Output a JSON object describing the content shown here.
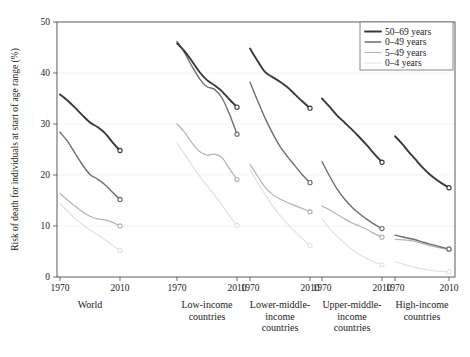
{
  "chart_data": {
    "type": "line",
    "title": "",
    "xlabel": "",
    "ylabel": "Risk of death for individuals at start of age range (%)",
    "ylim": [
      0,
      50
    ],
    "xlim": [
      1970,
      2010
    ],
    "yticks": [
      "0",
      "10",
      "20",
      "30",
      "40",
      "50"
    ],
    "ytick_values": [
      0,
      10,
      20,
      30,
      40,
      50
    ],
    "grid": "horizontal-faint",
    "legend_position": "top-right",
    "legend": [
      {
        "name": "50–69 years",
        "color": "#3a3a3a",
        "width": 1.9
      },
      {
        "name": "0–49 years",
        "color": "#6e6e6e",
        "width": 1.4
      },
      {
        "name": "5–49 years",
        "color": "#b4b4b4",
        "width": 1.2
      },
      {
        "name": "0–4 years",
        "color": "#e2e2e2",
        "width": 1.2
      }
    ],
    "panels": [
      {
        "label": "World",
        "label_lines": [
          "World"
        ],
        "xticks": [
          "1970",
          "2010"
        ],
        "series": [
          {
            "name": "50–69 years",
            "x": [
              1970,
              1975,
              1980,
              1985,
              1990,
              1995,
              2000,
              2005,
              2010
            ],
            "values": [
              35.8,
              34.6,
              33.2,
              31.7,
              30.3,
              29.4,
              28.2,
              26.4,
              24.8
            ],
            "endpoint_value": 24.8
          },
          {
            "name": "0–49 years",
            "x": [
              1970,
              1975,
              1980,
              1985,
              1990,
              1995,
              2000,
              2005,
              2010
            ],
            "values": [
              28.4,
              26.6,
              24.3,
              22.0,
              20.1,
              19.2,
              18.1,
              16.6,
              15.2
            ],
            "endpoint_value": 15.2
          },
          {
            "name": "5–49 years",
            "x": [
              1970,
              1975,
              1980,
              1985,
              1990,
              1995,
              2000,
              2005,
              2010
            ],
            "values": [
              16.4,
              15.1,
              13.9,
              12.8,
              11.9,
              11.4,
              11.2,
              10.7,
              10.0
            ],
            "endpoint_value": 10.0
          },
          {
            "name": "0–4 years",
            "x": [
              1970,
              1975,
              1980,
              1985,
              1990,
              1995,
              2000,
              2005,
              2010
            ],
            "values": [
              14.4,
              12.9,
              11.5,
              10.3,
              9.2,
              8.3,
              7.3,
              6.2,
              5.2
            ],
            "endpoint_value": 5.2
          }
        ]
      },
      {
        "label": "Low-income countries",
        "label_lines": [
          "Low-income",
          "countries"
        ],
        "xticks": [
          "1970",
          "2010"
        ],
        "series": [
          {
            "name": "50–69 years",
            "x": [
              1970,
              1975,
              1980,
              1985,
              1990,
              1995,
              2000,
              2005,
              2010
            ],
            "values": [
              45.8,
              44.3,
              42.3,
              40.2,
              38.6,
              37.6,
              36.4,
              34.8,
              33.3
            ],
            "endpoint_value": 33.3
          },
          {
            "name": "0–49 years",
            "x": [
              1970,
              1975,
              1980,
              1985,
              1990,
              1995,
              2000,
              2005,
              2010
            ],
            "values": [
              46.2,
              44.0,
              41.3,
              38.9,
              37.3,
              36.8,
              35.1,
              31.9,
              28.0
            ],
            "endpoint_value": 28.0
          },
          {
            "name": "5–49 years",
            "x": [
              1970,
              1975,
              1980,
              1985,
              1990,
              1995,
              2000,
              2005,
              2010
            ],
            "values": [
              30.0,
              28.4,
              26.3,
              24.6,
              23.9,
              24.1,
              23.4,
              21.2,
              19.1
            ],
            "endpoint_value": 19.1
          },
          {
            "name": "0–4 years",
            "x": [
              1970,
              1975,
              1980,
              1985,
              1990,
              1995,
              2000,
              2005,
              2010
            ],
            "values": [
              26.2,
              24.1,
              21.9,
              19.8,
              17.9,
              16.1,
              14.1,
              12.0,
              10.1
            ],
            "endpoint_value": 10.1
          }
        ]
      },
      {
        "label": "Lower-middle-income countries",
        "label_lines": [
          "Lower-middle-",
          "income",
          "countries"
        ],
        "xticks": [
          "1970",
          "2010"
        ],
        "series": [
          {
            "name": "50–69 years",
            "x": [
              1970,
              1975,
              1980,
              1985,
              1990,
              1995,
              2000,
              2005,
              2010
            ],
            "values": [
              44.8,
              42.4,
              40.2,
              39.2,
              38.3,
              37.2,
              35.8,
              34.4,
              33.1
            ],
            "endpoint_value": 33.1
          },
          {
            "name": "0–49 years",
            "x": [
              1970,
              1975,
              1980,
              1985,
              1990,
              1995,
              2000,
              2005,
              2010
            ],
            "values": [
              38.2,
              34.6,
              31.2,
              28.2,
              25.6,
              23.6,
              21.8,
              20.0,
              18.5
            ],
            "endpoint_value": 18.5
          },
          {
            "name": "5–49 years",
            "x": [
              1970,
              1975,
              1980,
              1985,
              1990,
              1995,
              2000,
              2005,
              2010
            ],
            "values": [
              22.1,
              19.8,
              17.6,
              16.2,
              15.3,
              14.6,
              14.0,
              13.4,
              12.8
            ],
            "endpoint_value": 12.8
          },
          {
            "name": "0–4 years",
            "x": [
              1970,
              1975,
              1980,
              1985,
              1990,
              1995,
              2000,
              2005,
              2010
            ],
            "values": [
              21.0,
              18.6,
              16.2,
              14.0,
              12.1,
              10.4,
              8.9,
              7.5,
              6.2
            ],
            "endpoint_value": 6.2
          }
        ]
      },
      {
        "label": "Upper-middle-income countries",
        "label_lines": [
          "Upper-middle-",
          "income",
          "countries"
        ],
        "xticks": [
          "1970",
          "2010"
        ],
        "series": [
          {
            "name": "50–69 years",
            "x": [
              1970,
              1975,
              1980,
              1985,
              1990,
              1995,
              2000,
              2005,
              2010
            ],
            "values": [
              35.0,
              33.4,
              31.7,
              30.3,
              28.9,
              27.4,
              25.8,
              24.1,
              22.5
            ],
            "endpoint_value": 22.5
          },
          {
            "name": "0–49 years",
            "x": [
              1970,
              1975,
              1980,
              1985,
              1990,
              1995,
              2000,
              2005,
              2010
            ],
            "values": [
              22.6,
              19.8,
              17.3,
              15.3,
              13.7,
              12.4,
              11.3,
              10.3,
              9.5
            ],
            "endpoint_value": 9.5
          },
          {
            "name": "5–49 years",
            "x": [
              1970,
              1975,
              1980,
              1985,
              1990,
              1995,
              2000,
              2005,
              2010
            ],
            "values": [
              13.9,
              13.2,
              12.3,
              11.4,
              10.6,
              10.0,
              9.3,
              8.5,
              7.8
            ],
            "endpoint_value": 7.8
          },
          {
            "name": "0–4 years",
            "x": [
              1970,
              1975,
              1980,
              1985,
              1990,
              1995,
              2000,
              2005,
              2010
            ],
            "values": [
              11.4,
              9.6,
              8.0,
              6.6,
              5.4,
              4.4,
              3.6,
              2.9,
              2.4
            ],
            "endpoint_value": 2.4
          }
        ]
      },
      {
        "label": "High-income countries",
        "label_lines": [
          "High-income",
          "countries"
        ],
        "xticks": [
          "1970",
          "2010"
        ],
        "series": [
          {
            "name": "50–69 years",
            "x": [
              1970,
              1975,
              1980,
              1985,
              1990,
              1995,
              2000,
              2005,
              2010
            ],
            "values": [
              27.6,
              26.2,
              24.6,
              23.1,
              21.6,
              20.3,
              19.2,
              18.3,
              17.5
            ],
            "endpoint_value": 17.5
          },
          {
            "name": "0–49 years",
            "x": [
              1970,
              1975,
              1980,
              1985,
              1990,
              1995,
              2000,
              2005,
              2010
            ],
            "values": [
              8.2,
              7.9,
              7.6,
              7.3,
              6.9,
              6.5,
              6.2,
              5.8,
              5.5
            ],
            "endpoint_value": 5.5
          },
          {
            "name": "5–49 years",
            "x": [
              1970,
              1975,
              1980,
              1985,
              1990,
              1995,
              2000,
              2005,
              2010
            ],
            "values": [
              7.4,
              7.3,
              7.2,
              7.0,
              6.6,
              6.2,
              5.9,
              5.6,
              5.4
            ],
            "endpoint_value": 5.4
          },
          {
            "name": "0–4 years",
            "x": [
              1970,
              1975,
              1980,
              1985,
              1990,
              1995,
              2000,
              2005,
              2010
            ],
            "values": [
              3.0,
              2.6,
              2.2,
              1.9,
              1.6,
              1.4,
              1.2,
              1.1,
              1.0
            ],
            "endpoint_value": 1.0
          }
        ]
      }
    ]
  },
  "axis": {
    "ylabel": "Risk of death for individuals at start of age range (%)"
  }
}
